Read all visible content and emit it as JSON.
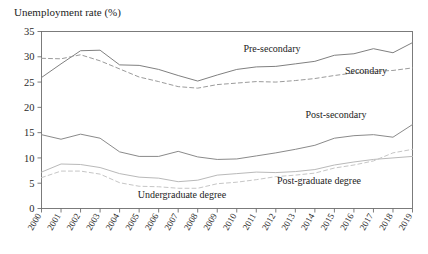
{
  "chart_data": {
    "type": "line",
    "title": "Unemployment rate (%)",
    "xlabel": "",
    "ylabel": "Unemployment rate (%)",
    "ylim": [
      0,
      35
    ],
    "yticks": [
      0,
      5,
      10,
      15,
      20,
      25,
      30,
      35
    ],
    "grid": false,
    "legend_position": "inline-annotations",
    "categories": [
      "2000",
      "2001",
      "2002",
      "2003",
      "2004",
      "2005",
      "2006",
      "2007",
      "2008",
      "2009",
      "2010",
      "2011",
      "2012",
      "2013",
      "2014",
      "2015",
      "2016",
      "2017",
      "2018",
      "2019"
    ],
    "series": [
      {
        "name": "Pre-secondary",
        "style": "solid",
        "color": "#808080",
        "values": [
          25.9,
          28.6,
          31.2,
          31.3,
          28.4,
          28.3,
          27.5,
          26.3,
          25.2,
          26.4,
          27.5,
          28.0,
          28.1,
          28.6,
          29.1,
          30.3,
          30.6,
          31.6,
          30.8,
          32.8
        ]
      },
      {
        "name": "Secondary",
        "style": "dashed",
        "color": "#9b9b9b",
        "values": [
          29.7,
          29.6,
          30.4,
          29.2,
          27.6,
          26.0,
          25.1,
          24.1,
          23.8,
          24.5,
          24.8,
          25.1,
          25.0,
          25.3,
          25.7,
          26.3,
          26.8,
          27.1,
          27.3,
          27.8
        ]
      },
      {
        "name": "Post-secondary",
        "style": "solid",
        "color": "#8a8a8a",
        "values": [
          14.6,
          13.7,
          14.7,
          13.9,
          11.2,
          10.3,
          10.3,
          11.3,
          10.2,
          9.7,
          9.8,
          10.4,
          11.0,
          11.7,
          12.5,
          13.9,
          14.4,
          14.6,
          14.1,
          16.6
        ]
      },
      {
        "name": "Undergraduate degree",
        "style": "solid",
        "color": "#b9b9b9",
        "values": [
          7.2,
          8.8,
          8.7,
          8.1,
          6.9,
          6.2,
          6.0,
          5.3,
          5.6,
          6.6,
          6.9,
          7.2,
          7.1,
          7.3,
          7.7,
          8.6,
          9.2,
          9.7,
          10.0,
          10.3
        ]
      },
      {
        "name": "Post-graduate degree",
        "style": "dashed",
        "color": "#c6c6c6",
        "values": [
          6.1,
          7.4,
          7.4,
          6.8,
          5.1,
          4.4,
          4.3,
          4.0,
          4.0,
          4.9,
          5.2,
          5.7,
          6.3,
          6.6,
          7.0,
          8.0,
          8.6,
          9.4,
          11.0,
          11.7
        ]
      }
    ],
    "annotations": [
      {
        "text": "Pre-secondary",
        "x_px": 272,
        "y_px": 52
      },
      {
        "text": "Secondary",
        "x_px": 366,
        "y_px": 74
      },
      {
        "text": "Post-secondary",
        "x_px": 336,
        "y_px": 118
      },
      {
        "text": "Post-graduate degree",
        "x_px": 319,
        "y_px": 184
      },
      {
        "text": "Undergraduate degree",
        "x_px": 182,
        "y_px": 198
      }
    ]
  }
}
